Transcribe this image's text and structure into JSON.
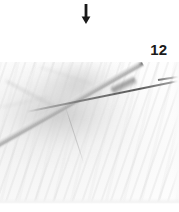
{
  "figure": {
    "panel_number": "12",
    "arrow_icon": "down-arrow-icon",
    "arrow_color": "#1a1a1a",
    "background_color": "#ffffff",
    "photo": {
      "instrument_color": "#5c5c5c",
      "needle_color": "#646464",
      "drape_color": "#f6f6f6"
    }
  }
}
